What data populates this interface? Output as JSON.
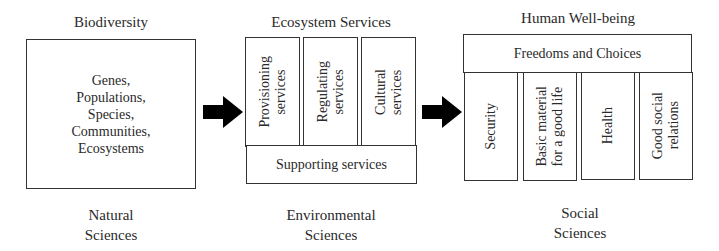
{
  "columns": [
    {
      "title": "Biodiversity",
      "items_text": [
        "Genes,",
        "Populations,",
        "Species,",
        "Communities,",
        "Ecosystems"
      ],
      "footer": [
        "Natural",
        "Sciences"
      ]
    },
    {
      "title": "Ecosystem Services",
      "services": [
        [
          "Provisioning",
          "services"
        ],
        [
          "Regulating",
          "services"
        ],
        [
          "Cultural",
          "services"
        ]
      ],
      "base": "Supporting services",
      "footer": [
        "Environmental",
        "Sciences"
      ]
    },
    {
      "title": "Human Well-being",
      "top": "Freedoms and Choices",
      "components": [
        [
          "Security"
        ],
        [
          "Basic material",
          "for a good life"
        ],
        [
          "Health"
        ],
        [
          "Good social",
          "relations"
        ]
      ],
      "footer": [
        "Social",
        "Sciences"
      ]
    }
  ],
  "arrows": [
    "right-arrow",
    "right-arrow"
  ],
  "colors": {
    "line": "#333333",
    "text": "#2a2a2a",
    "arrow": "#000000",
    "background": "#ffffff"
  }
}
